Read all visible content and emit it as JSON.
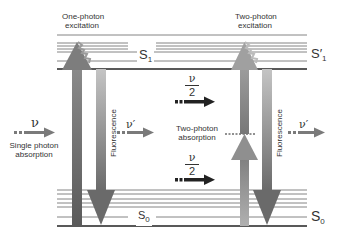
{
  "diagram": {
    "left_panel": {
      "title_line1": "One-photon",
      "title_line2": "excitation",
      "excited_state": "S",
      "excited_state_sub": "1",
      "ground_state": "S",
      "ground_state_sub": "0",
      "incident_photon": "ν",
      "incident_label_line1": "Single photon",
      "incident_label_line2": "absorption",
      "fluorescence_label": "Fluorescence",
      "emitted_photon": "ν′"
    },
    "right_panel": {
      "title_line1": "Two-photon",
      "title_line2": "excitation",
      "excited_state": "S′",
      "excited_state_sub": "1",
      "ground_state": "S",
      "ground_state_sub": "0",
      "incident_photon_top_num": "ν",
      "incident_photon_top_den": "2",
      "incident_photon_bottom_num": "ν",
      "incident_photon_bottom_den": "2",
      "virtual_state_label_line1": "Two-photon",
      "virtual_state_label_line2": "absorption",
      "fluorescence_label": "Fluorescence",
      "emitted_photon": "ν′"
    },
    "colors": {
      "level_line": "#555555",
      "level_line_thick": "#222222",
      "excitation_arrow": "#7a7a7a",
      "fluorescence_arrow": "#9a9a9a",
      "photon_arrow": "#6a6a6a",
      "dark_photon_arrow": "#222222"
    }
  }
}
